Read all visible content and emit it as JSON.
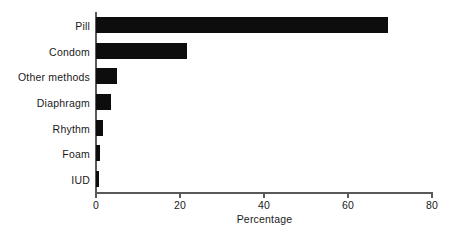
{
  "chart_data": {
    "type": "bar",
    "orientation": "horizontal",
    "title": "",
    "xlabel": "Percentage",
    "ylabel": "",
    "categories": [
      "Pill",
      "Condom",
      "Other methods",
      "Diaphragm",
      "Rhythm",
      "Foam",
      "IUD"
    ],
    "values": [
      69.6,
      21.7,
      5.0,
      3.5,
      1.7,
      1.0,
      0.6
    ],
    "xlim": [
      0,
      80
    ],
    "xticks": [
      0,
      20,
      40,
      60,
      80
    ],
    "xtick_labels": [
      "0",
      "20",
      "40",
      "60",
      "80"
    ],
    "grid": false,
    "legend": null,
    "bar_color": "#0d0d0d",
    "axis_color": "#5a5a5a",
    "background": "#ffffff"
  }
}
